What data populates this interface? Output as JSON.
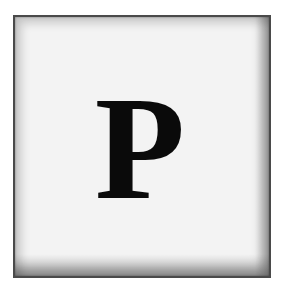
{
  "tile": {
    "letter": "P",
    "background_color": "#f3f3f3",
    "border_color": "#4a4a4a",
    "letter_color": "#0a0a0a"
  }
}
